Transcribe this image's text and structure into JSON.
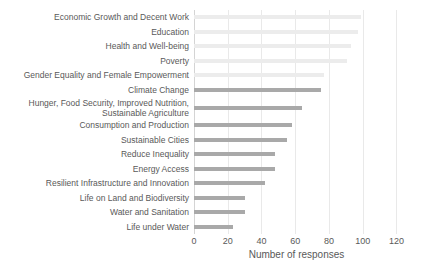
{
  "chart_data": {
    "type": "bar",
    "orientation": "horizontal",
    "title": "",
    "xlabel": "Number of responses",
    "ylabel": "",
    "xlim": [
      0,
      120
    ],
    "xticks": [
      0,
      20,
      40,
      60,
      80,
      100,
      120
    ],
    "grid": true,
    "legend": false,
    "categories": [
      "Economic Growth and Decent Work",
      "Education",
      "Health and Well-being",
      "Poverty",
      "Gender Equality and Female Empowerment",
      "Climate Change",
      "Hunger, Food Security, Improved Nutrition,\nSustainable Agriculture",
      "Consumption and Production",
      "Sustainable Cities",
      "Reduce Inequality",
      "Energy Access",
      "Resilient Infrastructure and Innovation",
      "Life on Land and Biodiversity",
      "Water and Sanitation",
      "Life under Water"
    ],
    "values": [
      99,
      97,
      93,
      91,
      77,
      75,
      64,
      58,
      55,
      48,
      48,
      42,
      30,
      30,
      23
    ],
    "shades": [
      "light",
      "light",
      "light",
      "light",
      "light",
      "dark",
      "dark",
      "dark",
      "dark",
      "dark",
      "dark",
      "dark",
      "dark",
      "dark",
      "dark"
    ],
    "colors": {
      "light": "#ececec",
      "dark": "#a9a9a9",
      "gridline": "#e9e9e9",
      "axis_line": "#d4d4d4",
      "text": "#595959"
    }
  }
}
